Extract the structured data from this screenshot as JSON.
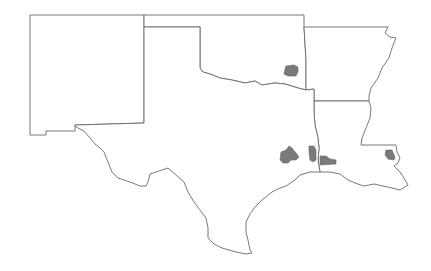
{
  "map": {
    "width": 431,
    "height": 271,
    "background": "#ffffff",
    "border_color": "#6a6a6a",
    "highlight_color": "#7a7a7a",
    "states": [
      {
        "name": "New Mexico",
        "path": "M30,15 L144,15 L144,123 L75,125 L75,131 L46,131 L46,135 L30,135 Z"
      },
      {
        "name": "Oklahoma",
        "path": "M144,15 L304,15 L304,27 L306,60 L306,90 L298,88 L285,84 L275,83 L262,85 L255,81 L245,83 L232,80 L220,78 L210,74 L203,72 L200,68 L200,27 L144,27 Z"
      },
      {
        "name": "Arkansas",
        "path": "M304,27 L388,27 L385,33 L390,37 L396,38 L392,48 L389,58 L382,68 L378,78 L371,88 L369,96 L369,101 L314,101 L314,89 L306,90 L306,60 Z"
      },
      {
        "name": "Louisiana",
        "path": "M314,101 L369,101 L371,108 L370,118 L366,128 L362,138 L361,145 L396,145 L397,152 L400,158 L398,163 L394,166 L400,172 L404,178 L408,185 L400,190 L392,188 L383,186 L374,184 L364,186 L355,183 L348,180 L340,174 L330,172 L320,172 L318,160 L319,148 L318,138 L315,125 L314,112 Z"
      },
      {
        "name": "Texas",
        "path": "M200,27 L200,68 L203,72 L210,74 L220,78 L232,80 L245,83 L255,81 L262,85 L275,83 L285,84 L298,88 L306,90 L314,89 L314,101 L314,112 L315,125 L318,138 L319,148 L318,160 L320,172 L310,172 L300,175 L295,180 L286,186 L280,188 L272,192 L262,200 L255,207 L250,214 L246,222 L246,232 L248,240 L250,250 L252,253 L246,254 L236,252 L222,248 L214,244 L208,238 L208,228 L206,218 L200,210 L194,202 L188,192 L184,182 L176,175 L168,168 L162,170 L156,172 L150,174 L148,182 L146,186 L140,186 L130,182 L118,178 L112,172 L108,162 L104,152 L100,148 L95,144 L90,138 L84,131 L76,127 L75,125 L144,123 L144,27 Z"
      }
    ],
    "highlighted_regions": [
      {
        "name": "region-oklahoma-east",
        "path": "M286,66 L294,65 L298,67 L298,72 L296,76 L288,76 L284,74 L285,69 Z"
      },
      {
        "name": "region-texas-central",
        "path": "M281,152 L286,150 L289,146 L292,148 L296,153 L299,157 L296,160 L291,160 L288,163 L283,163 L280,160 Z"
      },
      {
        "name": "region-texas-east-strip",
        "path": "M309,146 L314,146 L316,150 L316,160 L313,162 L310,160 L309,152 Z"
      },
      {
        "name": "region-texas-beaumont",
        "path": "M320,156 L326,156 L330,159 L336,160 L336,164 L320,165 Z"
      },
      {
        "name": "region-louisiana-east",
        "path": "M386,150 L392,150 L395,157 L394,160 L388,159 L385,155 Z"
      }
    ]
  }
}
